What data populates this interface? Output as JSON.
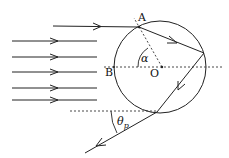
{
  "diagram": {
    "type": "optics-ray-diagram",
    "labels": {
      "point_A": "A",
      "point_B": "B",
      "center_O": "O",
      "angle_alpha": "α",
      "angle_theta": "θ",
      "angle_theta_sub": "p"
    },
    "colors": {
      "stroke": "#222222",
      "background": "#ffffff"
    },
    "circle": {
      "cx": 160,
      "cy": 67,
      "r": 46
    },
    "incident_rays_count": 6
  }
}
